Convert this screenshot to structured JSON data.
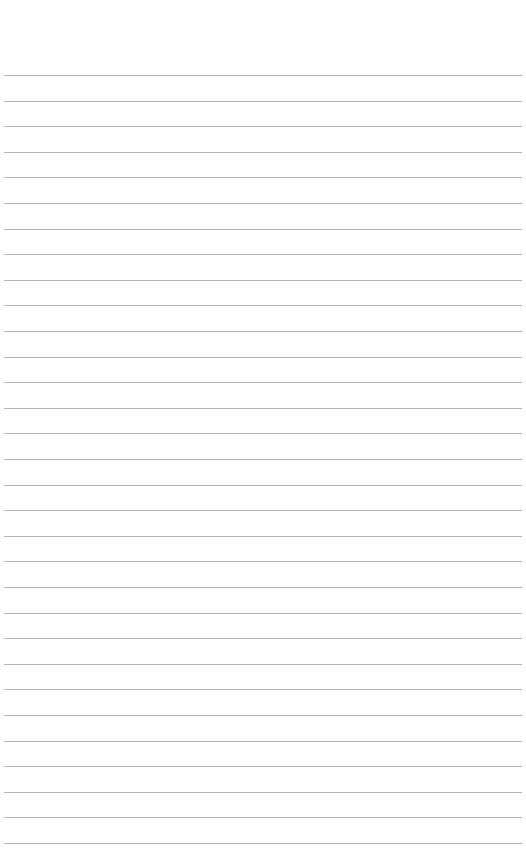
{
  "page": {
    "type": "lined-paper",
    "background": "#ffffff",
    "rule_color": "#b4b4b4",
    "rule_count": 31,
    "first_rule_y": 75,
    "rule_spacing": 25.6
  }
}
